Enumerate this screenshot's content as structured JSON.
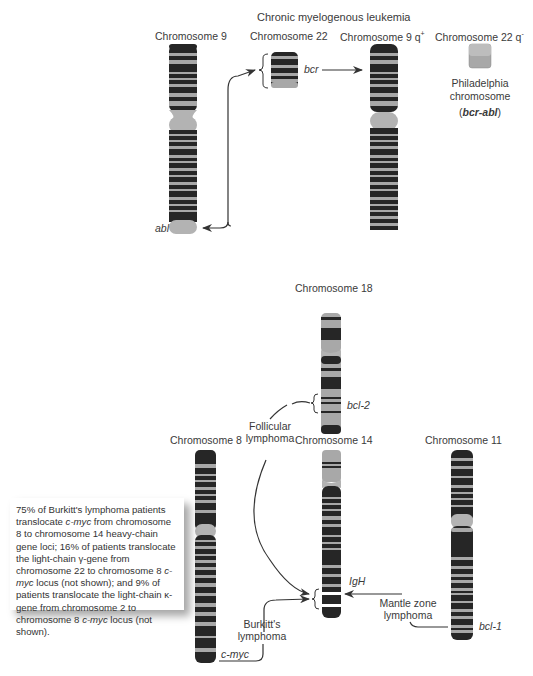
{
  "title": "Chronic myelogenous leukemia",
  "cml": {
    "chr9_label": "Chromosome 9",
    "chr22_label": "Chromosome 22",
    "chr9q_label": "Chromosome 9 q",
    "chr9q_sup": "+",
    "chr22q_label": "Chromosome 22 q",
    "chr22q_sup": "-",
    "bcr": "bcr",
    "abl": "abl",
    "philadelphia_1": "Philadelphia",
    "philadelphia_2": "chromosome",
    "bcr_abl_open": "(",
    "bcr_abl": "bcr-abl",
    "bcr_abl_close": ")"
  },
  "lymphoma": {
    "chr18_label": "Chromosome 18",
    "chr8_label": "Chromosome 8",
    "chr14_label": "Chromosome 14",
    "chr11_label": "Chromosome 11",
    "bcl2": "bcl-2",
    "igh": "IgH",
    "bcl1": "bcl-1",
    "cmyc": "c-myc",
    "follicular_1": "Follicular",
    "follicular_2": "lymphoma",
    "burkitt_1": "Burkitt's",
    "burkitt_2": "lymphoma",
    "mantle_1": "Mantle zone",
    "mantle_2": "lymphoma"
  },
  "note": {
    "p1": "75% of Burkitt's lymphoma patients translocate ",
    "cmyc1": "c-myc",
    "p2": " from chromosome 8 to chromosome 14 heavy-chain gene loci;  16% of patients translocate the light-chain γ-gene from chromosome 22 to chromosome 8 ",
    "cmyc2": "c-myc",
    "p3": " locus (not shown); and 9% of patients translocate the light-chain κ-gene from chromosome 2 to chromosome 8 ",
    "cmyc3": "c-myc",
    "p4": " locus (not shown)."
  },
  "colors": {
    "band_dark": "#262626",
    "band_light": "#a8a8a8",
    "centromere": "#b3b3b3",
    "arrow": "#333333"
  }
}
